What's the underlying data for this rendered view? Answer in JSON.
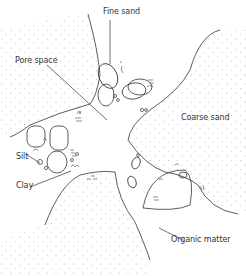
{
  "diagram": {
    "labels": {
      "fine_sand": "Fine sand",
      "pore_space": "Pore space",
      "coarse_sand": "Coarse sand",
      "silt": "Silt",
      "clay": "Clay",
      "organic_matter": "Organic matter"
    },
    "colors": {
      "line": "#333333",
      "stipple": "#aaaaaa",
      "background": "#ffffff"
    }
  }
}
